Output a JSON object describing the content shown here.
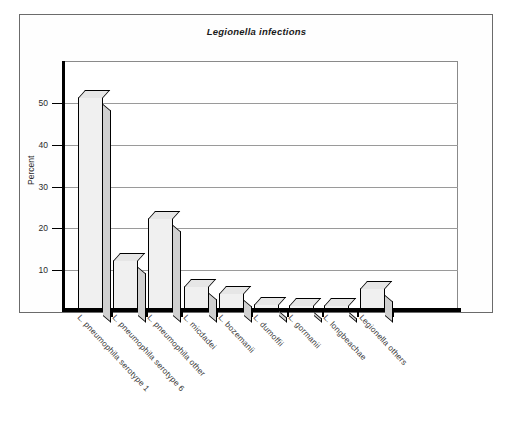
{
  "figure": {
    "title": "Legionella infections"
  },
  "chart_data": {
    "type": "bar",
    "title": "Legionella infections",
    "xlabel": "",
    "ylabel": "Percent",
    "ylim": [
      0,
      60
    ],
    "grid": true,
    "legend": "none",
    "yticks": [
      10,
      20,
      30,
      40,
      50
    ],
    "categories": [
      "L. pneumophila serotype 1",
      "L. pneumophila serotype 6",
      "L. pneumophila other",
      "L. micdadei",
      "L. bozemanii",
      "L. dumoffii",
      "L. gormanii",
      "L. longbeachae",
      "Legionella others"
    ],
    "values": [
      51.5,
      12,
      22,
      5.5,
      4,
      1.2,
      1,
      1,
      5
    ]
  },
  "axis": {
    "y_title": "Percent",
    "y_tick_labels": [
      "10",
      "20",
      "30",
      "40",
      "50"
    ]
  }
}
